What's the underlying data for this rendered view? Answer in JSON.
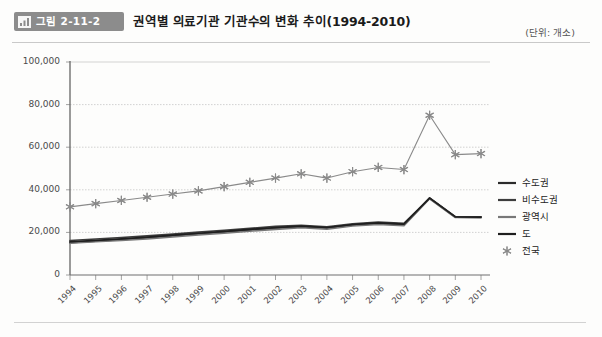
{
  "header": {
    "badge_label": "그림 2-11-2",
    "badge_icon": "bar-chart-icon",
    "title": "권역별 의료기관 기관수의 변화 추이(1994-2010)",
    "unit": "(단위: 개소)"
  },
  "chart_data": {
    "type": "line",
    "title": "권역별 의료기관 기관수의 변화 추이(1994-2010)",
    "xlabel": "",
    "ylabel": "",
    "unit": "개소",
    "grid": true,
    "legend_position": "right",
    "ylim": [
      0,
      100000
    ],
    "yticks": [
      0,
      20000,
      40000,
      60000,
      80000,
      100000
    ],
    "ytick_labels": [
      "0",
      "20,000",
      "40,000",
      "60,000",
      "80,000",
      "100,000"
    ],
    "categories": [
      "1994",
      "1995",
      "1996",
      "1997",
      "1998",
      "1999",
      "2000",
      "2001",
      "2002",
      "2003",
      "2004",
      "2005",
      "2006",
      "2007",
      "2008",
      "2009",
      "2010"
    ],
    "series": [
      {
        "name": "수도권",
        "color": "#2b2b2b",
        "marker": "none",
        "values": [
          15200,
          15900,
          16600,
          17400,
          18300,
          19200,
          20100,
          21000,
          21900,
          22600,
          22000,
          23400,
          24100,
          23500,
          36200,
          27400,
          27300
        ]
      },
      {
        "name": "비수도권",
        "color": "#3d3d3d",
        "marker": "none",
        "values": [
          16200,
          16900,
          17600,
          18400,
          19200,
          20100,
          21000,
          21900,
          22800,
          23300,
          22600,
          24000,
          24800,
          24300,
          36000,
          27200,
          27100
        ]
      },
      {
        "name": "광역시",
        "color": "#787878",
        "marker": "none",
        "values": [
          14900,
          15600,
          16300,
          17000,
          17900,
          18800,
          19700,
          20600,
          21400,
          22200,
          21500,
          23000,
          23800,
          23200,
          35800,
          27000,
          26900
        ]
      },
      {
        "name": "도",
        "color": "#1f1f1f",
        "marker": "none",
        "values": [
          15600,
          16300,
          17000,
          17800,
          18700,
          19600,
          20500,
          21400,
          22300,
          22900,
          22300,
          23700,
          24500,
          23900,
          36100,
          27300,
          27200
        ]
      },
      {
        "name": "전국",
        "color": "#8a8a8a",
        "marker": "asterisk",
        "values": [
          32000,
          33500,
          35000,
          36500,
          38000,
          39500,
          41500,
          43500,
          45500,
          47500,
          45500,
          48500,
          50500,
          49500,
          75000,
          56500,
          57000
        ]
      }
    ]
  }
}
